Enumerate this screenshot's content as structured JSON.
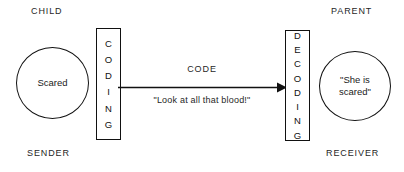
{
  "diagram": {
    "type": "communication-process-flow",
    "background_color": "#ffffff",
    "line_color": "#111111",
    "text_color": "#1a1a1a",
    "labels": {
      "top_left": "CHILD",
      "top_right": "PARENT",
      "bottom_left": "SENDER",
      "bottom_right": "RECEIVER"
    },
    "sender_node": {
      "shape": "circle",
      "text": "Scared"
    },
    "receiver_node": {
      "shape": "circle",
      "text": "\"She is\nscared\""
    },
    "coding_box": {
      "text": "CODING",
      "orientation": "vertical",
      "letters": [
        "C",
        "O",
        "D",
        "I",
        "N",
        "G"
      ]
    },
    "decoding_box": {
      "text": "DECODING",
      "orientation": "vertical",
      "letters": [
        "D",
        "E",
        "C",
        "O",
        "D",
        "I",
        "N",
        "G"
      ]
    },
    "arrow": {
      "direction": "left-to-right",
      "label_above": "CODE",
      "label_below": "\"Look at all that blood!\""
    }
  }
}
